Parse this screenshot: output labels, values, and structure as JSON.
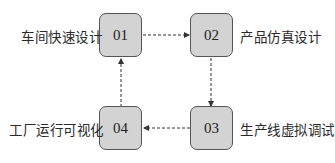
{
  "diagram": {
    "nodes": [
      {
        "id": "01",
        "label": "车间快速设计"
      },
      {
        "id": "02",
        "label": "产品仿真设计"
      },
      {
        "id": "03",
        "label": "生产线虚拟调试"
      },
      {
        "id": "04",
        "label": "工厂运行可视化"
      }
    ],
    "edges": [
      {
        "from": "01",
        "to": "02",
        "style": "dashed"
      },
      {
        "from": "02",
        "to": "03",
        "style": "dashed"
      },
      {
        "from": "03",
        "to": "04",
        "style": "dashed"
      },
      {
        "from": "04",
        "to": "01",
        "style": "dashed"
      }
    ],
    "colors": {
      "node_fill": "#d3d3d3",
      "node_border": "#555555",
      "edge": "#333333"
    }
  }
}
